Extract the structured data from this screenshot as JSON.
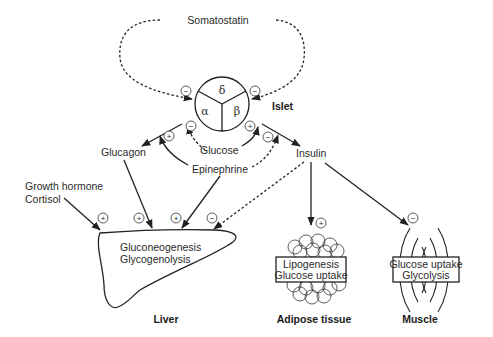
{
  "diagram": {
    "islet": {
      "label": "Islet",
      "cells": {
        "delta": "δ",
        "alpha": "α",
        "beta": "β"
      }
    },
    "hormones": {
      "somatostatin": "Somatostatin",
      "glucagon": "Glucagon",
      "insulin": "Insulin",
      "glucose": "Glucose",
      "epinephrine": "Epinephrine",
      "growth_hormone": "Growth hormone",
      "cortisol": "Cortisol"
    },
    "liver": {
      "label": "Liver",
      "processes": [
        "Gluconeogenesis",
        "Glycogenolysis"
      ]
    },
    "adipose": {
      "label": "Adipose tissue",
      "processes": [
        "Lipogenesis",
        "Glucose uptake"
      ]
    },
    "muscle": {
      "label": "Muscle",
      "processes": [
        "Glucose uptake",
        "Glycolysis"
      ]
    },
    "signs": {
      "plus": "+",
      "minus": "−"
    },
    "effects": [
      {
        "from": "Somatostatin",
        "to": "alpha cell",
        "sign": "−"
      },
      {
        "from": "Somatostatin",
        "to": "beta cell",
        "sign": "−"
      },
      {
        "from": "Glucose",
        "to": "alpha cell",
        "sign": "−"
      },
      {
        "from": "Epinephrine",
        "to": "Glucagon",
        "sign": "+"
      },
      {
        "from": "Glucose",
        "to": "beta cell",
        "sign": "+"
      },
      {
        "from": "Epinephrine",
        "to": "Insulin",
        "sign": "−"
      },
      {
        "from": "Growth hormone / Cortisol",
        "to": "Liver",
        "sign": "+"
      },
      {
        "from": "Glucagon",
        "to": "Liver",
        "sign": "+"
      },
      {
        "from": "Epinephrine",
        "to": "Liver",
        "sign": "+"
      },
      {
        "from": "Insulin",
        "to": "Liver",
        "sign": "−"
      },
      {
        "from": "Insulin",
        "to": "Adipose tissue",
        "sign": "+"
      },
      {
        "from": "Insulin",
        "to": "Muscle",
        "sign": "−"
      }
    ]
  }
}
